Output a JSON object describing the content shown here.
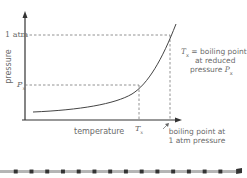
{
  "diagram": {
    "type": "vapor-pressure-vs-temperature",
    "y_axis_label": "pressure",
    "x_axis_label": "temperature",
    "y_ticks": {
      "atm": "1 atm",
      "px_main": "P",
      "px_sub": "x"
    },
    "x_ticks": {
      "tx_main": "T",
      "tx_sub": "x"
    },
    "annotation_reduced": {
      "line1_main": "T",
      "line1_sub": "x",
      "line1_rest": " = boiling point",
      "line2": "at reduced",
      "line3_text": "pressure ",
      "line3_var": "P",
      "line3_sub": "x"
    },
    "annotation_atm": {
      "line1": "boiling point at",
      "line2": "1 atm pressure"
    },
    "colors": {
      "axis": "#333333",
      "curve": "#444444",
      "dashed": "#777777",
      "text": "#6a6a6a",
      "bar_light": "#b0b0b0",
      "bar_dark": "#333333"
    }
  }
}
